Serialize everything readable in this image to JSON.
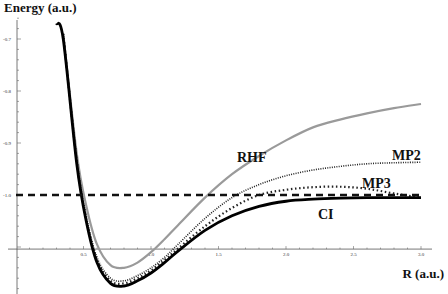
{
  "chart_data": {
    "type": "line",
    "title": "",
    "xlabel": "R (a.u.)",
    "ylabel": "Energy (a.u.)",
    "xlim": [
      0.0,
      3.05
    ],
    "ylim": [
      -1.2,
      -0.66
    ],
    "x_axis_crossing_y": -1.104,
    "xticks": [
      0.5,
      1.0,
      1.5,
      2.0,
      2.5,
      3.0
    ],
    "xtick_labels": [
      "0.5",
      "1.0",
      "1.5",
      "2.0",
      "2.5",
      "3.0"
    ],
    "yticks": [
      -0.7,
      -0.8,
      -0.9,
      -1.0
    ],
    "ytick_labels": [
      "-0.7",
      "-0.8",
      "-0.9",
      "-1.0"
    ],
    "grid": false,
    "legend": "inline labels",
    "series": [
      {
        "name": "RHF",
        "style": "solid gray",
        "color": "#999999",
        "x": [
          0.35,
          0.45,
          0.52,
          0.6,
          0.7,
          0.8,
          0.9,
          1.0,
          1.1,
          1.2,
          1.4,
          1.6,
          1.8,
          2.0,
          2.2,
          2.4,
          2.6,
          2.8,
          3.0
        ],
        "y": [
          -0.69,
          -0.92,
          -1.02,
          -1.095,
          -1.135,
          -1.14,
          -1.13,
          -1.11,
          -1.085,
          -1.058,
          -1.005,
          -0.96,
          -0.925,
          -0.895,
          -0.87,
          -0.855,
          -0.843,
          -0.833,
          -0.825
        ]
      },
      {
        "name": "MP2",
        "style": "fine dotted",
        "color": "#222222",
        "x": [
          0.35,
          0.45,
          0.52,
          0.6,
          0.7,
          0.8,
          0.9,
          1.0,
          1.1,
          1.2,
          1.4,
          1.6,
          1.8,
          2.0,
          2.2,
          2.4,
          2.6,
          2.8,
          3.0
        ],
        "y": [
          -0.69,
          -0.93,
          -1.04,
          -1.12,
          -1.16,
          -1.165,
          -1.155,
          -1.14,
          -1.12,
          -1.095,
          -1.045,
          -1.005,
          -0.98,
          -0.963,
          -0.952,
          -0.945,
          -0.94,
          -0.938,
          -0.937
        ]
      },
      {
        "name": "MP3",
        "style": "dotted",
        "color": "#222222",
        "x": [
          0.35,
          0.45,
          0.52,
          0.6,
          0.7,
          0.8,
          0.9,
          1.0,
          1.1,
          1.2,
          1.4,
          1.6,
          1.8,
          2.0,
          2.2,
          2.4,
          2.6,
          2.8,
          3.0
        ],
        "y": [
          -0.69,
          -0.935,
          -1.045,
          -1.125,
          -1.165,
          -1.17,
          -1.16,
          -1.145,
          -1.125,
          -1.103,
          -1.06,
          -1.025,
          -1.0,
          -0.99,
          -0.985,
          -0.984,
          -0.988,
          -0.997,
          -1.005
        ]
      },
      {
        "name": "CI",
        "style": "solid black thick",
        "color": "#000000",
        "x": [
          0.3,
          0.35,
          0.45,
          0.52,
          0.6,
          0.7,
          0.8,
          0.9,
          1.0,
          1.1,
          1.2,
          1.4,
          1.6,
          1.8,
          2.0,
          2.2,
          2.4,
          2.6,
          2.8,
          3.0
        ],
        "y": [
          -0.67,
          -0.7,
          -0.94,
          -1.05,
          -1.13,
          -1.17,
          -1.175,
          -1.165,
          -1.15,
          -1.13,
          -1.108,
          -1.068,
          -1.04,
          -1.022,
          -1.012,
          -1.008,
          -1.006,
          -1.005,
          -1.005,
          -1.005
        ]
      },
      {
        "name": "Exact dissociation limit",
        "style": "dashed",
        "color": "#000000",
        "x": [
          0.0,
          3.0
        ],
        "y": [
          -1.0,
          -1.0
        ]
      }
    ],
    "annotations": [
      "RHF",
      "MP2",
      "MP3",
      "CI"
    ]
  },
  "labels": {
    "ylabel": "Energy (a.u.)",
    "xlabel": "R (a.u.)",
    "rhf": "RHF",
    "mp2": "MP2",
    "mp3": "MP3",
    "ci": "CI"
  }
}
